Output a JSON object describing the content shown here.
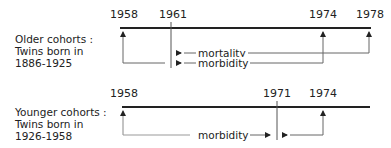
{
  "older": {
    "label_line1": "Older cohorts :",
    "label_line2": "Twins born in",
    "label_line3": "1886-1925",
    "years": [
      "1958",
      "1961",
      "1974",
      "1978"
    ],
    "mortality_label": "mortality",
    "morbidity_label": "morbidity"
  },
  "younger": {
    "label_line1": "Younger cohorts :",
    "label_line2": "Twins born in",
    "label_line3": "1926-1958",
    "years": [
      "1958",
      "1971",
      "1974"
    ],
    "morbidity_label": "morbidity"
  },
  "colors": {
    "line": "#222222"
  }
}
